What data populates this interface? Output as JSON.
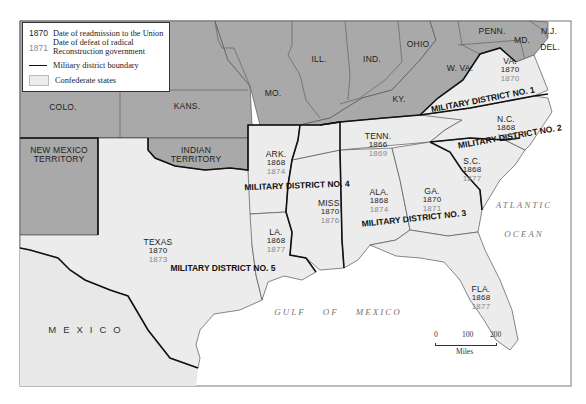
{
  "colors": {
    "union_states": "#a9a9a9",
    "confederate_states": "#ececec",
    "mexico": "#e8e8e8",
    "water": "#ffffff",
    "state_border": "#555555",
    "district_boundary": "#111111",
    "readmission_year": "#1e1e1e",
    "defeat_year": "#8a8a8a"
  },
  "legend": {
    "readmission": {
      "key": "1870",
      "label": "Date of readmission to the Union"
    },
    "defeat": {
      "key": "1871",
      "label_line1": "Date of defeat of radical",
      "label_line2": "Reconstruction government"
    },
    "boundary": {
      "label": "Military district boundary"
    },
    "confederate": {
      "label": "Confederate states"
    }
  },
  "union_labels": {
    "colo": "COLO.",
    "kans": "KANS.",
    "mo": "MO.",
    "ill": "ILL.",
    "ind": "IND.",
    "ohio": "OHIO",
    "penn": "PENN.",
    "nj": "N.J.",
    "md": "MD.",
    "del": "DEL.",
    "wva": "W. VA.",
    "ky": "KY.",
    "nm_line1": "NEW MEXICO",
    "nm_line2": "TERRITORY",
    "it_line1": "INDIAN",
    "it_line2": "TERRITORY"
  },
  "confederate_states": [
    {
      "id": "va",
      "name": "VA.",
      "readmitted": "1870",
      "defeated": "1870",
      "x": 510,
      "y": 70
    },
    {
      "id": "nc",
      "name": "N.C.",
      "readmitted": "1868",
      "defeated": "1870",
      "x": 506,
      "y": 128
    },
    {
      "id": "sc",
      "name": "S.C.",
      "readmitted": "1868",
      "defeated": "1877",
      "x": 472,
      "y": 170
    },
    {
      "id": "ga",
      "name": "GA.",
      "readmitted": "1870",
      "defeated": "1871",
      "x": 432,
      "y": 200
    },
    {
      "id": "fla",
      "name": "FLA.",
      "readmitted": "1868",
      "defeated": "1877",
      "x": 481,
      "y": 298
    },
    {
      "id": "ala",
      "name": "ALA.",
      "readmitted": "1868",
      "defeated": "1874",
      "x": 379,
      "y": 201
    },
    {
      "id": "miss",
      "name": "MISS.",
      "readmitted": "1870",
      "defeated": "1876",
      "x": 330,
      "y": 212
    },
    {
      "id": "la",
      "name": "LA.",
      "readmitted": "1868",
      "defeated": "1877",
      "x": 276,
      "y": 241
    },
    {
      "id": "ark",
      "name": "ARK.",
      "readmitted": "1868",
      "defeated": "1874",
      "x": 276,
      "y": 163
    },
    {
      "id": "tenn",
      "name": "TENN.",
      "readmitted": "1866",
      "defeated": "1869",
      "x": 378,
      "y": 145
    },
    {
      "id": "texas",
      "name": "TEXAS",
      "readmitted": "1870",
      "defeated": "1873",
      "x": 158,
      "y": 251
    }
  ],
  "military_districts": [
    {
      "label": "MILITARY DISTRICT NO. 1",
      "x": 483,
      "y": 100,
      "rotate": -11
    },
    {
      "label": "MILITARY DISTRICT NO. 2",
      "x": 510,
      "y": 137,
      "rotate": -10
    },
    {
      "label": "MILITARY DISTRICT NO. 3",
      "x": 414,
      "y": 219,
      "rotate": -6
    },
    {
      "label": "MILITARY DISTRICT NO. 4",
      "x": 297,
      "y": 186,
      "rotate": -2
    },
    {
      "label": "MILITARY DISTRICT NO. 5",
      "x": 223,
      "y": 269,
      "rotate": 0
    }
  ],
  "water_labels": {
    "atlantic": "ATLANTIC",
    "ocean": "OCEAN",
    "gulf": "GULF    OF    MEXICO"
  },
  "mexico_label": "MEXICO",
  "scale": {
    "tick0": "0",
    "tick1": "100",
    "tick2": "200",
    "unit": "Miles"
  }
}
